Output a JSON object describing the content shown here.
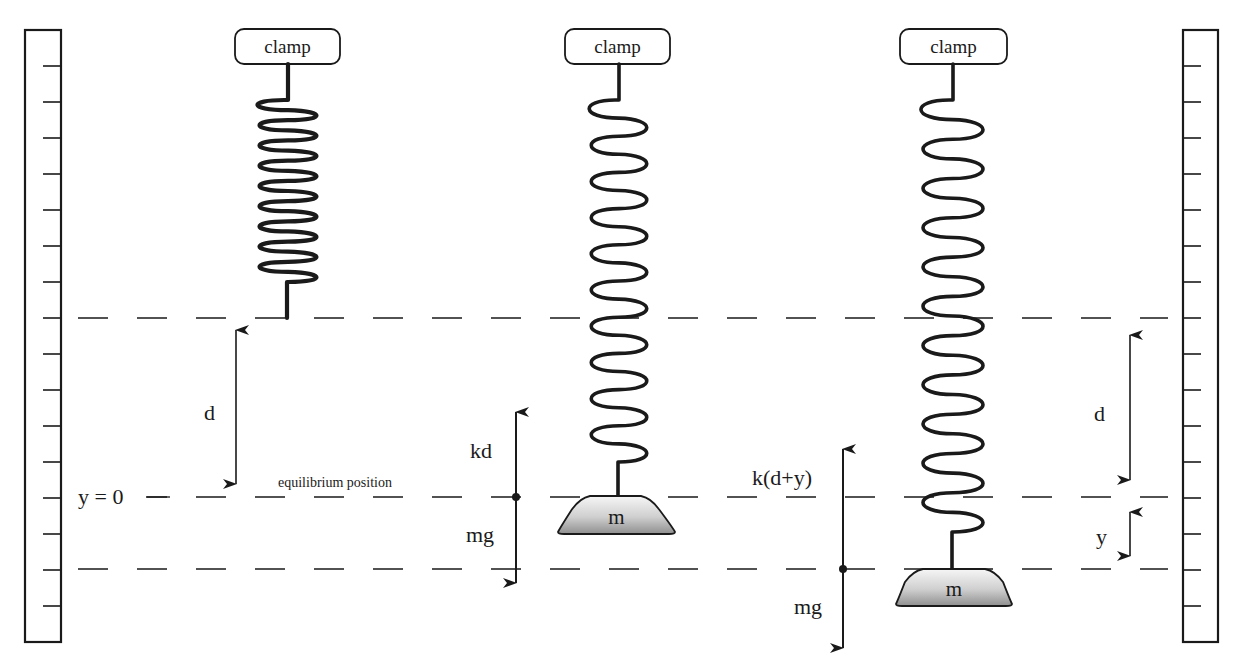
{
  "diagram": {
    "rulers": {
      "left": {
        "x": 25,
        "width": 36,
        "top": 30,
        "bottom": 642,
        "tick_side": "right"
      },
      "right": {
        "x": 1183,
        "width": 35,
        "top": 30,
        "bottom": 642,
        "tick_side": "left"
      },
      "tick_ys": [
        66,
        102,
        138,
        174,
        210,
        246,
        282,
        318,
        354,
        390,
        426,
        462,
        498,
        534,
        570,
        606
      ],
      "tick_length": 18
    },
    "reference_lines": [
      {
        "name": "unstretched-spring-end-line",
        "y": 318
      },
      {
        "name": "equilibrium-line",
        "y": 497
      },
      {
        "name": "displaced-position-line",
        "y": 569
      }
    ],
    "labels": {
      "y_zero": "y = 0",
      "equilibrium": "equilibrium position",
      "d_left": "d",
      "d_right": "d",
      "y_right": "y",
      "kd": "kd",
      "mg_1": "mg",
      "k_d_plus_y": "k(d+y)",
      "mg_2": "mg"
    },
    "springs": [
      {
        "name": "unstretched",
        "clamp_label": "clamp",
        "clamp_x": 235,
        "clamp_w": 105,
        "center_x": 288,
        "coil_top": 100,
        "coil_bottom": 282,
        "coil_half_width": 36,
        "loops": 9,
        "end_y": 318,
        "mass": null
      },
      {
        "name": "equilibrium",
        "clamp_label": "clamp",
        "clamp_x": 565,
        "clamp_w": 105,
        "center_x": 619,
        "coil_top": 100,
        "coil_bottom": 462,
        "coil_half_width": 35,
        "loops": 10,
        "end_y": 496,
        "mass": {
          "label": "m",
          "top_y": 496,
          "bottom_y": 534,
          "top_l": 590,
          "top_r": 641,
          "base_l": 558,
          "base_r": 675
        }
      },
      {
        "name": "displaced",
        "clamp_label": "clamp",
        "clamp_x": 900,
        "clamp_w": 107,
        "center_x": 953,
        "coil_top": 100,
        "coil_bottom": 532,
        "coil_half_width": 38,
        "loops": 11,
        "end_y": 569,
        "mass": {
          "label": "m",
          "top_y": 569,
          "bottom_y": 606,
          "top_l": 923,
          "top_r": 985,
          "base_l": 896,
          "base_r": 1012
        }
      }
    ],
    "colors": {
      "stroke": "#1a1a1a",
      "mass_light": "#f4f4f4",
      "mass_dark": "#9a9a9a",
      "background": "#ffffff"
    }
  }
}
